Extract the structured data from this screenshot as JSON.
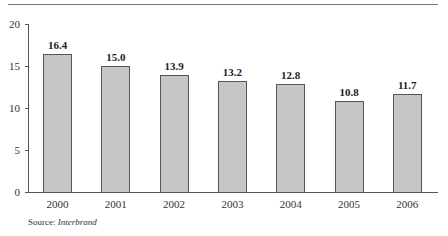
{
  "chart_data": {
    "type": "bar",
    "title": "",
    "xlabel": "",
    "ylabel": "",
    "categories": [
      "2000",
      "2001",
      "2002",
      "2003",
      "2004",
      "2005",
      "2006"
    ],
    "values": [
      16.4,
      15.0,
      13.9,
      13.2,
      12.8,
      10.8,
      11.7
    ],
    "data_labels": [
      "16.4",
      "15.0",
      "13.9",
      "13.2",
      "12.8",
      "10.8",
      "11.7"
    ],
    "ylim": [
      0,
      20
    ],
    "yticks": [
      0,
      5,
      10,
      15,
      20
    ],
    "ytick_labels": [
      "0",
      "5",
      "10",
      "15",
      "20"
    ],
    "grid": false,
    "legend": null,
    "bar_color": "#c6c6c6",
    "bar_edge_color": "#555555"
  },
  "source": {
    "prefix": "Source:",
    "name": "Interbrand"
  }
}
